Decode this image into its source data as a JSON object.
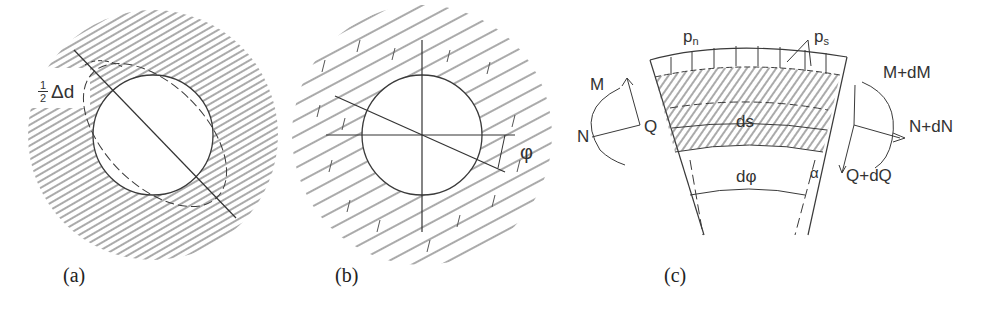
{
  "figure": {
    "panels": [
      {
        "id": "a",
        "caption": "(a)",
        "labels": {
          "half_num": "1",
          "half_den": "2",
          "delta_d": "Δd"
        },
        "description": "Circular opening in hatched rock mass; dashed ellipse showing ovalization with diameter change ½Δd along inclined axis"
      },
      {
        "id": "b",
        "caption": "(b)",
        "labels": {
          "phi": "φ"
        },
        "description": "Circular opening in bedded rock mass with horizontal/vertical axes and inclined axis at angle φ"
      },
      {
        "id": "c",
        "caption": "(c)",
        "labels": {
          "p_n": "p",
          "p_n_sub": "n",
          "p_s": "p",
          "p_s_sub": "s",
          "M": "M",
          "N": "N",
          "Q": "Q",
          "ds": "ds",
          "dphi": "dφ",
          "alpha": "α",
          "M_dM": "M+dM",
          "N_dN": "N+dN",
          "Q_dQ": "Q+dQ"
        },
        "description": "Free-body element of lining segment with normal load pn, shear load ps, internal forces M, N, Q and increments"
      }
    ],
    "colors": {
      "line": "#3a3a3a",
      "hatch": "#555555",
      "background": "#ffffff"
    }
  }
}
